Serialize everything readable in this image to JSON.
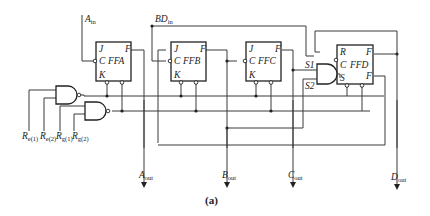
{
  "diagram": {
    "type": "logic-circuit",
    "caption": "(a)",
    "inputs": {
      "a_in": {
        "main": "A",
        "sub": "in"
      },
      "bd_in": {
        "main": "BD",
        "sub": "in"
      },
      "reset": [
        {
          "main": "R",
          "sub": "e(1)"
        },
        {
          "main": "R",
          "sub": "e(2)"
        },
        {
          "main": "R",
          "sub": "g(1)"
        },
        {
          "main": "R",
          "sub": "g(2)"
        }
      ]
    },
    "outputs": [
      {
        "main": "A",
        "sub": "out"
      },
      {
        "main": "B",
        "sub": "out"
      },
      {
        "main": "C",
        "sub": "out"
      },
      {
        "main": "D",
        "sub": "out"
      }
    ],
    "flipflops": [
      {
        "name": "FFA",
        "pins": [
          "J",
          "C",
          "K",
          "F"
        ]
      },
      {
        "name": "FFB",
        "pins": [
          "J",
          "C",
          "K",
          "F"
        ]
      },
      {
        "name": "FFC",
        "pins": [
          "J",
          "C",
          "K",
          "F"
        ]
      },
      {
        "name": "FFD",
        "pins": [
          "R",
          "C",
          "S",
          "F",
          "F"
        ]
      }
    ],
    "and_gate_inputs": [
      "S1",
      "S2"
    ]
  }
}
